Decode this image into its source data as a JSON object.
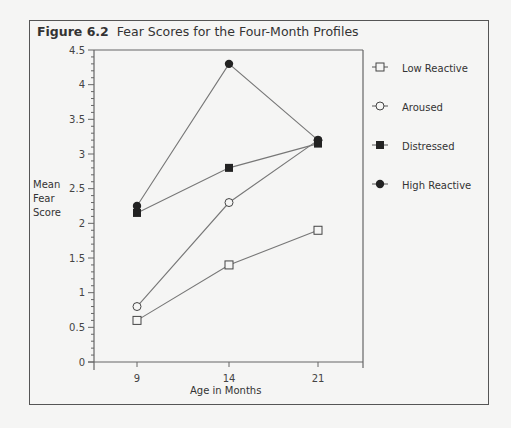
{
  "figure": {
    "number": "Figure 6.2",
    "title": "Fear Scores for the Four-Month Profiles"
  },
  "chart_data": {
    "type": "line",
    "title": "Fear Scores for the Four-Month Profiles",
    "xlabel": "Age in Months",
    "ylabel": "Mean Fear Score",
    "x": [
      9,
      14,
      21
    ],
    "categories": [
      "9",
      "14",
      "21"
    ],
    "ylim": [
      0,
      4.5
    ],
    "yticks": [
      "0",
      "0.5",
      "1",
      "1.5",
      "2",
      "2.5",
      "3",
      "3.5",
      "4",
      "4.5"
    ],
    "grid": false,
    "legend_position": "right",
    "series": [
      {
        "name": "Low Reactive",
        "marker": "open-square",
        "values": [
          0.6,
          1.4,
          1.9
        ]
      },
      {
        "name": "Aroused",
        "marker": "open-circle",
        "values": [
          0.8,
          2.3,
          3.2
        ]
      },
      {
        "name": "Distressed",
        "marker": "filled-square",
        "values": [
          2.15,
          2.8,
          3.15
        ]
      },
      {
        "name": "High Reactive",
        "marker": "filled-circle",
        "values": [
          2.25,
          4.3,
          3.2
        ]
      }
    ]
  },
  "axis": {
    "ylabel_lines": [
      "Mean",
      "Fear",
      "Score"
    ],
    "xlabel": "Age in Months"
  },
  "legend": [
    {
      "label": "Low Reactive",
      "icon": "open-square-icon"
    },
    {
      "label": "Aroused",
      "icon": "open-circle-icon"
    },
    {
      "label": "Distressed",
      "icon": "filled-square-icon"
    },
    {
      "label": "High Reactive",
      "icon": "filled-circle-icon"
    }
  ]
}
